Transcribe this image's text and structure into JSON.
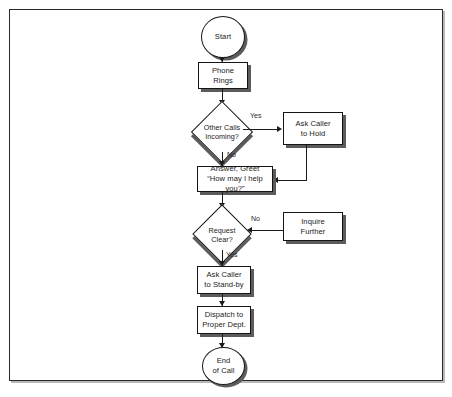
{
  "diagram": {
    "frame": {
      "visible": true
    },
    "nodes": {
      "start": {
        "label": "Start",
        "shape": "terminator"
      },
      "phone_rings": {
        "label": "Phone\nRings",
        "shape": "process"
      },
      "other_calls": {
        "label": "Other Calls\nIncoming?",
        "shape": "decision"
      },
      "ask_hold": {
        "label": "Ask Caller\nto Hold",
        "shape": "process"
      },
      "answer_greet": {
        "label": "Answer, Greet\n“How may I help you?”",
        "shape": "process"
      },
      "request_clear": {
        "label": "Request\nClear?",
        "shape": "decision"
      },
      "inquire_further": {
        "label": "Inquire\nFurther",
        "shape": "process"
      },
      "ask_standby": {
        "label": "Ask Caller\nto Stand-by",
        "shape": "process"
      },
      "dispatch": {
        "label": "Dispatch to\nProper Dept.",
        "shape": "process"
      },
      "end": {
        "label": "End\nof Call",
        "shape": "terminator"
      }
    },
    "branch_labels": {
      "other_calls_yes": "Yes",
      "other_calls_no": "No",
      "request_clear_no": "No",
      "request_clear_yes": "Yes"
    },
    "edges": [
      {
        "from": "start",
        "to": "phone_rings",
        "label": ""
      },
      {
        "from": "phone_rings",
        "to": "other_calls",
        "label": ""
      },
      {
        "from": "other_calls",
        "to": "ask_hold",
        "label": "Yes"
      },
      {
        "from": "other_calls",
        "to": "answer_greet",
        "label": "No"
      },
      {
        "from": "ask_hold",
        "to": "answer_greet",
        "label": ""
      },
      {
        "from": "answer_greet",
        "to": "request_clear",
        "label": ""
      },
      {
        "from": "request_clear",
        "to": "inquire_further",
        "label": "No"
      },
      {
        "from": "inquire_further",
        "to": "request_clear",
        "label": ""
      },
      {
        "from": "request_clear",
        "to": "ask_standby",
        "label": "Yes"
      },
      {
        "from": "ask_standby",
        "to": "dispatch",
        "label": ""
      },
      {
        "from": "dispatch",
        "to": "end",
        "label": ""
      }
    ],
    "colors": {
      "stroke": "#151515",
      "shadow": "#5c5c5c",
      "fill": "#ffffff",
      "frame": "#2a2a2a"
    }
  }
}
